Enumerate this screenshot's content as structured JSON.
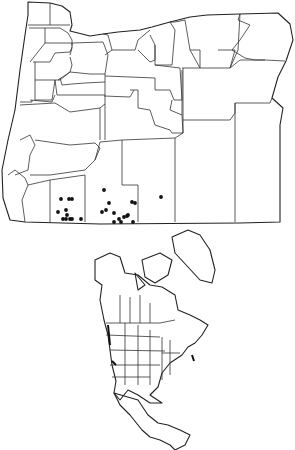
{
  "figure": {
    "panels": [
      {
        "id": "oregon",
        "description": "Oregon county outline map with occurrence dots"
      },
      {
        "id": "north-america",
        "description": "North America political outline map with shaded range"
      }
    ]
  },
  "oregon_dots": [
    [
      61,
      199
    ],
    [
      69,
      199
    ],
    [
      72,
      199
    ],
    [
      58,
      212
    ],
    [
      66,
      210
    ],
    [
      67,
      215
    ],
    [
      63,
      219
    ],
    [
      66,
      219
    ],
    [
      70,
      219
    ],
    [
      72,
      219
    ],
    [
      81,
      219
    ],
    [
      104,
      190
    ],
    [
      109,
      203
    ],
    [
      106,
      210
    ],
    [
      102,
      212
    ],
    [
      114,
      213
    ],
    [
      114,
      222
    ],
    [
      119,
      219
    ],
    [
      124,
      217
    ],
    [
      127,
      216
    ],
    [
      128,
      215
    ],
    [
      121,
      222
    ],
    [
      132,
      202
    ],
    [
      135,
      203
    ],
    [
      133,
      222
    ],
    [
      161,
      197
    ]
  ],
  "colors": {
    "line": "#333333",
    "dot": "#111111",
    "background": "#ffffff"
  }
}
